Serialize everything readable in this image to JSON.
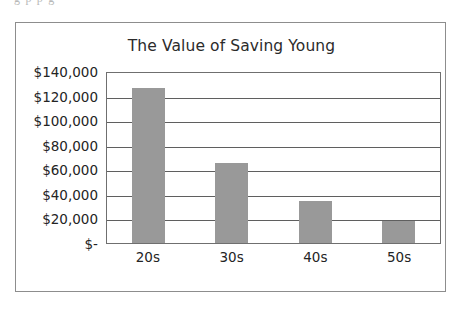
{
  "page": {
    "cut_off_text_top": "g        p  p        g"
  },
  "chart_data": {
    "type": "bar",
    "title": "The Value of Saving Young",
    "xlabel": "",
    "ylabel": "",
    "categories": [
      "20s",
      "30s",
      "40s",
      "50s"
    ],
    "values": [
      126000,
      65000,
      34000,
      18000
    ],
    "ylim": [
      0,
      140000
    ],
    "ytick_values": [
      140000,
      120000,
      100000,
      80000,
      60000,
      40000,
      20000,
      0
    ],
    "ytick_labels": [
      "$140,000",
      "$120,000",
      "$100,000",
      "$80,000",
      "$60,000",
      "$40,000",
      "$20,000",
      "$-"
    ],
    "grid": true,
    "legend": false,
    "legend_position": "none",
    "series": [
      {
        "name": "Value of Saving",
        "values": [
          126000,
          65000,
          34000,
          18000
        ],
        "color": "#999999"
      }
    ],
    "colors": {
      "bar_fill": "#999999",
      "gridline": "#5f5f5f",
      "plot_border": "#6f6f6f",
      "frame_border": "#8d8d8d",
      "text": "#242424",
      "background": "#ffffff"
    }
  }
}
